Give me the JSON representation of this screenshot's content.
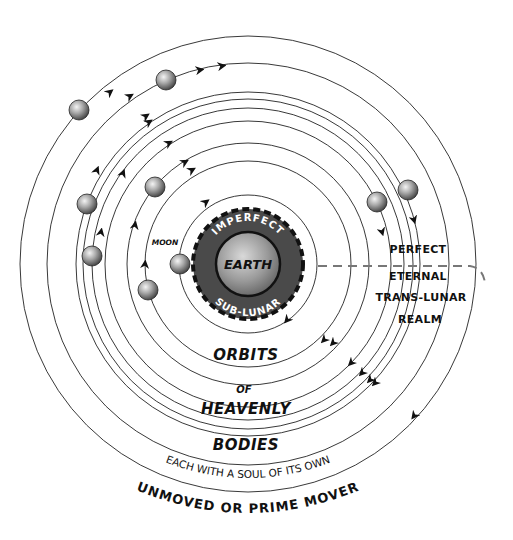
{
  "diagram": {
    "center": {
      "x": 248,
      "y": 264
    },
    "earth": {
      "label": "EARTH",
      "ring_top_label": "IMPERFECT",
      "ring_bottom_label": "SUB-LUNAR",
      "sphere_radius": 32,
      "ring_radius": 55
    },
    "moon": {
      "label": "MOON",
      "x": 180,
      "y": 264,
      "orbit_radius": 69
    },
    "orbit_radii": [
      103,
      121,
      143,
      156,
      165,
      172,
      201,
      228
    ],
    "planets": [
      {
        "x": 79,
        "y": 110
      },
      {
        "x": 166,
        "y": 80
      },
      {
        "x": 87,
        "y": 204
      },
      {
        "x": 155,
        "y": 187
      },
      {
        "x": 92,
        "y": 256
      },
      {
        "x": 148,
        "y": 290
      },
      {
        "x": 377,
        "y": 202
      },
      {
        "x": 408,
        "y": 190
      }
    ],
    "realm_labels": [
      "PERFECT",
      "ETERNAL",
      "TRANS-LUNAR",
      "REALM"
    ],
    "orbit_labels": {
      "line1": "ORBITS",
      "line2": "OF",
      "line3": "HEAVENLY",
      "line4": "BODIES"
    },
    "soul_label": "EACH WITH A SOUL OF ITS OWN",
    "prime_mover_label": "UNMOVED OR PRIME MOVER",
    "colors": {
      "line": "#222222",
      "earth_ring": "#4a4a4a",
      "dashed": "#777777",
      "text": "#111111"
    }
  }
}
